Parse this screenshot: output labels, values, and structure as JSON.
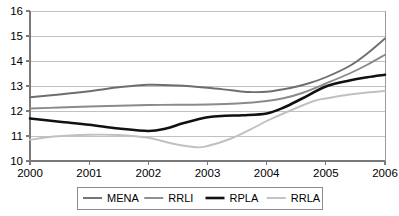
{
  "chart_data": {
    "type": "line",
    "title": "",
    "subtitle": "",
    "xlabel": "",
    "ylabel": "",
    "x": [
      2000,
      2001,
      2002,
      2003,
      2004,
      2005,
      2006
    ],
    "xtick_labels": [
      "2000",
      "2001",
      "2002",
      "2003",
      "2004",
      "2005",
      "2006"
    ],
    "ytick_labels": [
      "10",
      "11",
      "12",
      "13",
      "14",
      "15",
      "16"
    ],
    "yticks": [
      10,
      11,
      12,
      13,
      14,
      15,
      16
    ],
    "xlim": [
      2000,
      2006
    ],
    "ylim": [
      10,
      16
    ],
    "grid": "horizontal",
    "legend_position": "bottom",
    "series": [
      {
        "name": "MENA",
        "color": "#6e6e6e",
        "width": 1.9,
        "values": [
          12.55,
          12.78,
          13.05,
          12.92,
          12.78,
          13.25,
          14.9
        ],
        "dense_x": [
          2000,
          2000.5,
          2001,
          2001.5,
          2002,
          2002.5,
          2003,
          2003.4,
          2003.7,
          2004,
          2004.4,
          2004.7,
          2005,
          2005.4,
          2005.7,
          2006
        ],
        "dense_y": [
          12.55,
          12.66,
          12.79,
          12.95,
          13.05,
          13.02,
          12.93,
          12.83,
          12.76,
          12.77,
          12.92,
          13.1,
          13.35,
          13.8,
          14.3,
          14.9
        ]
      },
      {
        "name": "RRLI",
        "color": "#8a8a8a",
        "width": 1.9,
        "values": [
          12.1,
          12.18,
          12.24,
          12.26,
          12.38,
          13.05,
          14.25
        ],
        "dense_x": [
          2000,
          2000.5,
          2001,
          2001.5,
          2002,
          2002.5,
          2003,
          2003.5,
          2004,
          2004.3,
          2004.6,
          2005,
          2005.4,
          2005.7,
          2006
        ],
        "dense_y": [
          12.1,
          12.14,
          12.18,
          12.21,
          12.24,
          12.25,
          12.26,
          12.3,
          12.4,
          12.52,
          12.72,
          13.1,
          13.5,
          13.85,
          14.25
        ]
      },
      {
        "name": "RPLA",
        "color": "#111111",
        "width": 2.6,
        "values": [
          11.7,
          11.45,
          11.2,
          11.78,
          11.88,
          13.0,
          13.45
        ],
        "dense_x": [
          2000,
          2000.5,
          2001,
          2001.5,
          2002,
          2002.3,
          2002.6,
          2003,
          2003.3,
          2003.6,
          2004,
          2004.3,
          2004.6,
          2005,
          2005.4,
          2005.7,
          2006
        ],
        "dense_y": [
          11.7,
          11.57,
          11.45,
          11.3,
          11.2,
          11.3,
          11.52,
          11.75,
          11.81,
          11.83,
          11.9,
          12.15,
          12.5,
          12.98,
          13.22,
          13.35,
          13.45
        ]
      },
      {
        "name": "RRLA",
        "color": "#c0c0c0",
        "width": 1.9,
        "values": [
          10.85,
          11.05,
          10.95,
          10.7,
          11.85,
          12.6,
          12.8
        ],
        "dense_x": [
          2000,
          2000.4,
          2001,
          2001.5,
          2002,
          2002.4,
          2002.8,
          2003,
          2003.4,
          2003.8,
          2004,
          2004.4,
          2004.8,
          2005,
          2005.4,
          2005.7,
          2006
        ],
        "dense_y": [
          10.85,
          10.98,
          11.05,
          11.04,
          10.93,
          10.7,
          10.55,
          10.6,
          10.9,
          11.35,
          11.6,
          12.02,
          12.4,
          12.5,
          12.66,
          12.74,
          12.8
        ]
      }
    ]
  },
  "legend": {
    "entries": [
      {
        "label": "MENA"
      },
      {
        "label": "RRLI"
      },
      {
        "label": "RPLA"
      },
      {
        "label": "RRLA"
      }
    ]
  }
}
